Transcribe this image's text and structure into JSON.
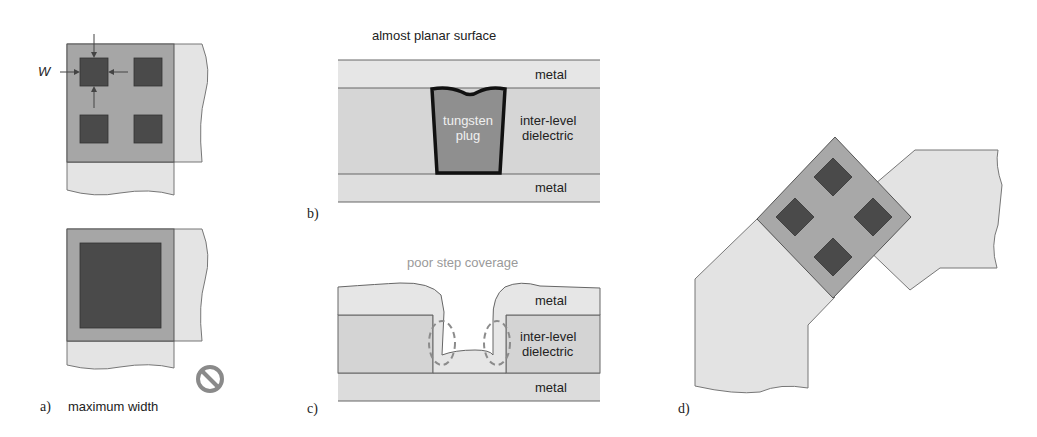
{
  "figure": {
    "panel_a": {
      "label": "a)",
      "caption": "maximum width",
      "dimension_label": "W",
      "icon": "prohibited-icon"
    },
    "panel_b": {
      "label": "b)",
      "title": "almost planar surface",
      "layers": {
        "top": "metal",
        "middle_line1": "inter-level",
        "middle_line2": "dielectric",
        "bottom": "metal"
      },
      "plug_line1": "tungsten",
      "plug_line2": "plug"
    },
    "panel_c": {
      "label": "c)",
      "title": "poor step coverage",
      "layers": {
        "top": "metal",
        "middle_line1": "inter-level",
        "middle_line2": "dielectric",
        "bottom": "metal"
      }
    },
    "panel_d": {
      "label": "d)"
    }
  },
  "colors": {
    "metal_light": "#e2e2e2",
    "via_region": "#a8a8a8",
    "contact_dark": "#4a4a4a",
    "dielectric": "#d4d4d4",
    "plug": "#8f8f8f",
    "outline": "#555555"
  }
}
